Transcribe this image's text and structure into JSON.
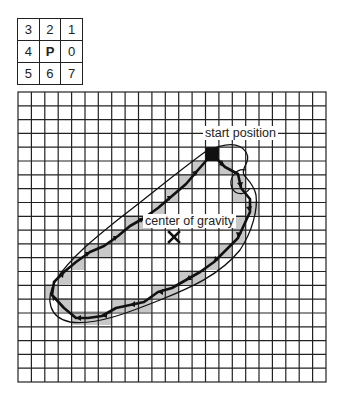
{
  "direction_grid": {
    "rows": [
      [
        "3",
        "2",
        "1"
      ],
      [
        "4",
        "P",
        "0"
      ],
      [
        "5",
        "6",
        "7"
      ]
    ],
    "center_label": "P"
  },
  "grid": {
    "columns": 23,
    "rows": 21,
    "line_color": "#222222"
  },
  "labels": {
    "start": "start position",
    "center": "center of gravity"
  },
  "colors": {
    "fill": "#c8c8c8",
    "chain": "#111111",
    "start_marker": "#111111"
  }
}
